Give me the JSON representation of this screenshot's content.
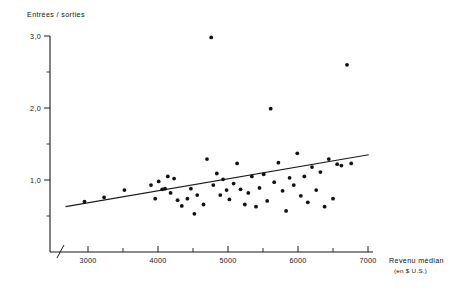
{
  "chart_data": {
    "type": "scatter",
    "title": "",
    "ylabel": "Entrées / sorties",
    "xlabel": "Revenu médian",
    "xlabel_units": "(en $ U.S.)",
    "xlim": [
      2600,
      7100
    ],
    "ylim": [
      0.25,
      3.1
    ],
    "grid": false,
    "legend": null,
    "x_major_ticks": [
      3000,
      4000,
      5000,
      6000,
      7000
    ],
    "x_major_tick_labels": [
      "3000",
      "4000",
      "5000",
      "6000",
      "7000"
    ],
    "x_minor_ticks": [
      3500,
      4500,
      5500,
      6500
    ],
    "y_major_ticks": [
      1.0,
      2.0,
      3.0
    ],
    "y_major_tick_labels": [
      "1,0",
      "2,0",
      "3,0"
    ],
    "y_minor_ticks": [
      0.5,
      1.5,
      2.5
    ],
    "axis_break": "x-axis break near origin",
    "points": [
      {
        "x": 2950,
        "y": 0.7
      },
      {
        "x": 3230,
        "y": 0.76
      },
      {
        "x": 3520,
        "y": 0.86
      },
      {
        "x": 3900,
        "y": 0.93
      },
      {
        "x": 3960,
        "y": 0.74
      },
      {
        "x": 4010,
        "y": 0.98
      },
      {
        "x": 4060,
        "y": 0.87
      },
      {
        "x": 4100,
        "y": 0.88
      },
      {
        "x": 4140,
        "y": 1.05
      },
      {
        "x": 4180,
        "y": 0.82
      },
      {
        "x": 4230,
        "y": 1.02
      },
      {
        "x": 4280,
        "y": 0.72
      },
      {
        "x": 4340,
        "y": 0.64
      },
      {
        "x": 4420,
        "y": 0.74
      },
      {
        "x": 4470,
        "y": 0.88
      },
      {
        "x": 4520,
        "y": 0.53
      },
      {
        "x": 4560,
        "y": 0.79
      },
      {
        "x": 4650,
        "y": 0.66
      },
      {
        "x": 4700,
        "y": 1.29
      },
      {
        "x": 4760,
        "y": 2.98
      },
      {
        "x": 4790,
        "y": 0.93
      },
      {
        "x": 4840,
        "y": 1.09
      },
      {
        "x": 4890,
        "y": 0.79
      },
      {
        "x": 4930,
        "y": 1.01
      },
      {
        "x": 4980,
        "y": 0.86
      },
      {
        "x": 5020,
        "y": 0.73
      },
      {
        "x": 5080,
        "y": 0.95
      },
      {
        "x": 5130,
        "y": 1.23
      },
      {
        "x": 5180,
        "y": 0.87
      },
      {
        "x": 5240,
        "y": 0.66
      },
      {
        "x": 5290,
        "y": 0.82
      },
      {
        "x": 5340,
        "y": 1.05
      },
      {
        "x": 5400,
        "y": 0.63
      },
      {
        "x": 5450,
        "y": 0.89
      },
      {
        "x": 5510,
        "y": 1.08
      },
      {
        "x": 5560,
        "y": 0.71
      },
      {
        "x": 5610,
        "y": 1.99
      },
      {
        "x": 5660,
        "y": 0.97
      },
      {
        "x": 5720,
        "y": 1.24
      },
      {
        "x": 5780,
        "y": 0.85
      },
      {
        "x": 5830,
        "y": 0.57
      },
      {
        "x": 5880,
        "y": 1.03
      },
      {
        "x": 5940,
        "y": 0.93
      },
      {
        "x": 5990,
        "y": 1.37
      },
      {
        "x": 6040,
        "y": 0.78
      },
      {
        "x": 6090,
        "y": 1.05
      },
      {
        "x": 6140,
        "y": 0.69
      },
      {
        "x": 6200,
        "y": 1.18
      },
      {
        "x": 6260,
        "y": 0.86
      },
      {
        "x": 6320,
        "y": 1.11
      },
      {
        "x": 6380,
        "y": 0.63
      },
      {
        "x": 6440,
        "y": 1.29
      },
      {
        "x": 6500,
        "y": 0.74
      },
      {
        "x": 6560,
        "y": 1.22
      },
      {
        "x": 6620,
        "y": 1.2
      },
      {
        "x": 6700,
        "y": 2.6
      },
      {
        "x": 6760,
        "y": 1.23
      }
    ],
    "trendline": {
      "type": "linear",
      "x_start": 2680,
      "y_start": 0.63,
      "x_end": 7010,
      "y_end": 1.35
    }
  }
}
